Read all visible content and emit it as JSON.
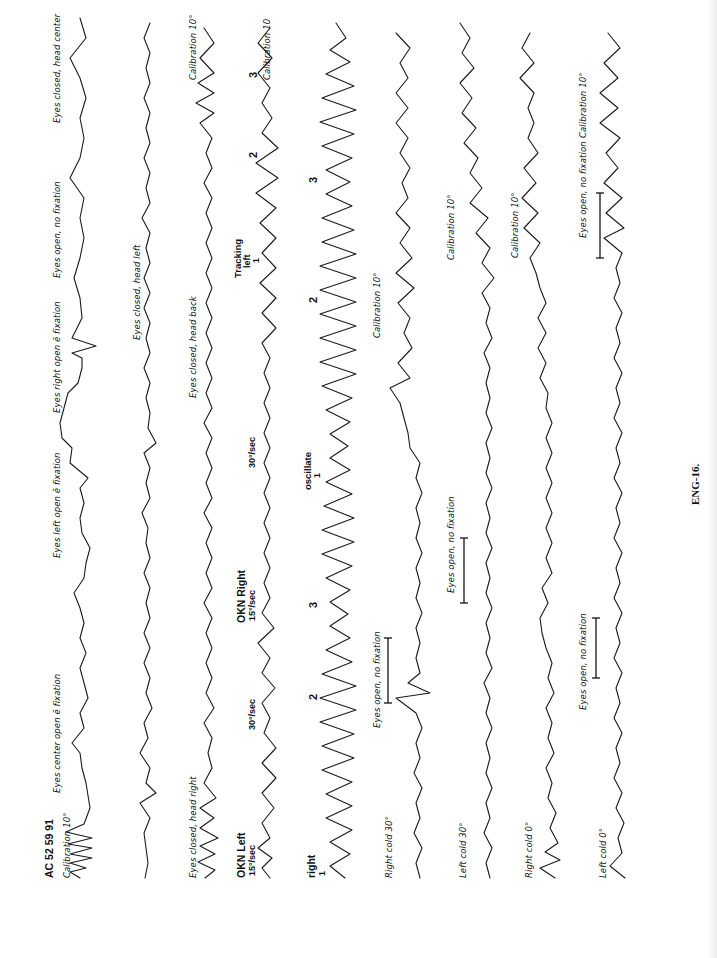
{
  "document": {
    "figure_caption": "ENG-16.",
    "orientation": "rotated 90° counter-clockwise",
    "patient_id": "AC 52 59 91"
  },
  "rows": [
    {
      "id": "row1",
      "labels": {
        "calibration_start": "Calibration 10°",
        "eyes_center": "Eyes center open ē fixation",
        "eyes_left": "Eyes left open ē fixation",
        "eyes_right": "Eyes right open ē fixation",
        "eyes_open_no_fix": "Eyes open, no fixation",
        "eyes_closed_center": "Eyes closed, head center"
      }
    },
    {
      "id": "row2",
      "labels": {
        "eyes_closed_left": "Eyes closed, head left"
      }
    },
    {
      "id": "row3",
      "labels": {
        "eyes_closed_right": "Eyes closed, head right",
        "eyes_closed_back": "Eyes closed, head back",
        "calibration_end": "Calibration 10°"
      }
    },
    {
      "id": "row4",
      "labels": {
        "okn_left": "OKN Left",
        "okn_left_speed": "15°/sec",
        "okn_left_speed2": "30°/sec",
        "okn_right": "OKN Right",
        "okn_right_speed": "15°/sec",
        "okn_right_speed2": "30°/sec",
        "tracking": "Tracking",
        "tracking_dir": "left",
        "tracking_num": "1",
        "mark2": "2",
        "mark3": "3",
        "calibration_end": "Calibration 10"
      }
    },
    {
      "id": "row5",
      "labels": {
        "right": "right",
        "right_num": "1",
        "mark2": "2",
        "mark3": "3",
        "oscillate": "oscillate",
        "oscillate_num": "1",
        "osc_mark2": "2",
        "osc_mark3": "3"
      }
    },
    {
      "id": "row6",
      "labels": {
        "right_cold": "Right cold  30°",
        "eyes_open_no_fix": "Eyes open, no fixation",
        "calibration": "Calibration 10°"
      }
    },
    {
      "id": "row7",
      "labels": {
        "left_cold": "Left cold  30°",
        "eyes_open_no_fix": "Eyes open, no fixation",
        "calibration": "Calibration 10°"
      }
    },
    {
      "id": "row8",
      "labels": {
        "right_cold": "Right cold  0°",
        "calibration": "Calibration 10°"
      }
    },
    {
      "id": "row9",
      "labels": {
        "left_cold": "Left cold  0°",
        "eyes_open_no_fix": "Eyes open, no fixation",
        "calibration": "Calibration 10°"
      }
    }
  ]
}
